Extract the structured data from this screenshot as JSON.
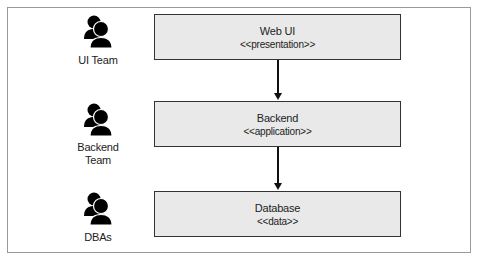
{
  "diagram": {
    "teams": [
      {
        "label": "UI Team",
        "icon": "people-group-icon"
      },
      {
        "label": "Backend Team",
        "label_lines": [
          "Backend",
          "Team"
        ],
        "icon": "people-group-icon"
      },
      {
        "label": "DBAs",
        "icon": "people-group-icon"
      }
    ],
    "layers": [
      {
        "title": "Web UI",
        "stereotype": "<<presentation>>"
      },
      {
        "title": "Backend",
        "stereotype": "<<application>>"
      },
      {
        "title": "Database",
        "stereotype": "<<data>>"
      }
    ],
    "edges": [
      {
        "from": "Web UI",
        "to": "Backend"
      },
      {
        "from": "Backend",
        "to": "Database"
      }
    ],
    "colors": {
      "box_fill": "#e9e9e9",
      "box_border": "#333333",
      "icon": "#000000",
      "frame_border": "#9a9a9a"
    }
  }
}
